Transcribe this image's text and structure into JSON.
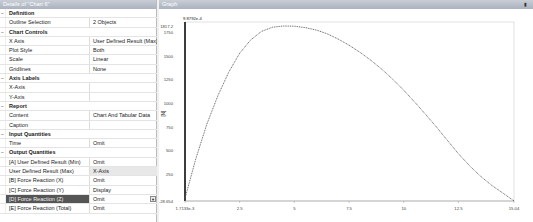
{
  "details_panel": {
    "title": "Details of \"Chart 6\"",
    "rows": [
      {
        "type": "category",
        "label": "Definition"
      },
      {
        "type": "prop",
        "key": "Outline Selection",
        "value": "2 Objects"
      },
      {
        "type": "category",
        "label": "Chart Controls"
      },
      {
        "type": "prop",
        "key": "X Axis",
        "value": "User Defined Result (Max)"
      },
      {
        "type": "prop",
        "key": "Plot Style",
        "value": "Both"
      },
      {
        "type": "prop",
        "key": "Scale",
        "value": "Linear"
      },
      {
        "type": "prop",
        "key": "Gridlines",
        "value": "None"
      },
      {
        "type": "category",
        "label": "Axis Labels"
      },
      {
        "type": "prop",
        "key": "X-Axis",
        "value": ""
      },
      {
        "type": "prop",
        "key": "Y-Axis",
        "value": ""
      },
      {
        "type": "category",
        "label": "Report"
      },
      {
        "type": "prop",
        "key": "Content",
        "value": "Chart And Tabular Data"
      },
      {
        "type": "prop",
        "key": "Caption",
        "value": ""
      },
      {
        "type": "category",
        "label": "Input Quantities"
      },
      {
        "type": "prop",
        "key": "Time",
        "value": "Omit"
      },
      {
        "type": "category",
        "label": "Output Quantities"
      },
      {
        "type": "prop",
        "key": "[A] User Defined Result (Min)",
        "value": "Omit"
      },
      {
        "type": "prop",
        "key": "User Defined Result (Max)",
        "value": "X-Axis",
        "highlight": true
      },
      {
        "type": "prop",
        "key": "[B] Force Reaction  (X)",
        "value": "Omit"
      },
      {
        "type": "prop",
        "key": "[C] Force Reaction  (Y)",
        "value": "Display"
      },
      {
        "type": "prop",
        "key": "[D] Force Reaction  (Z)",
        "value": "Omit",
        "selected": true
      },
      {
        "type": "prop",
        "key": "[E] Force Reaction  (Total)",
        "value": "Omit"
      }
    ]
  },
  "graph_panel": {
    "title": "Graph",
    "pin_icon": "pin-icon"
  },
  "chart_data": {
    "type": "line",
    "title": "",
    "top_label": "9.8792e-4",
    "xlabel": "",
    "ylabel": "[N]",
    "xlim": [
      0.0017133,
      15.04
    ],
    "ylim": [
      -28.654,
      1817.2
    ],
    "x_tick_labels": [
      "1.7133e-3",
      "2.5",
      "5",
      "7.5",
      "10",
      "12.5",
      "15.04"
    ],
    "x_ticks": [
      0.0017133,
      2.5,
      5,
      7.5,
      10,
      12.5,
      15.04
    ],
    "y_tick_labels": [
      "-28.654",
      "250",
      "500",
      "750",
      "1000",
      "1250",
      "1500",
      "1750",
      "1817.2"
    ],
    "y_ticks": [
      -28.654,
      250,
      500,
      750,
      1000,
      1250,
      1500,
      1750,
      1817.2
    ],
    "grid": false,
    "series": [
      {
        "name": "[C] Force Reaction (Y)",
        "x": [
          0.0017,
          0.5,
          1.0,
          1.5,
          2.0,
          2.5,
          3.0,
          3.5,
          4.0,
          4.5,
          5.0,
          5.5,
          6.0,
          6.5,
          7.0,
          7.5,
          8.0,
          8.5,
          9.0,
          9.5,
          10.0,
          10.5,
          11.0,
          11.5,
          12.0,
          12.5,
          13.0,
          13.5,
          14.0,
          14.5,
          15.04
        ],
        "values": [
          0,
          420,
          780,
          1080,
          1330,
          1530,
          1670,
          1760,
          1805,
          1817,
          1815,
          1800,
          1775,
          1735,
          1680,
          1615,
          1540,
          1455,
          1360,
          1255,
          1140,
          1015,
          885,
          750,
          610,
          470,
          345,
          235,
          140,
          60,
          -28
        ]
      }
    ]
  }
}
